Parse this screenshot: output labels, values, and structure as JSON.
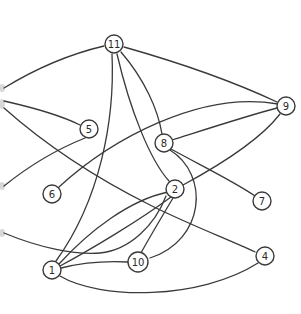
{
  "graph": {
    "title": "",
    "colors": {
      "stroke": "#3a3a3a",
      "node_fill": "#ffffff",
      "label": "#2a2a2a",
      "background": "#ffffff"
    },
    "nodes": [
      {
        "id": "11",
        "label": "11",
        "x": 114,
        "y": 44
      },
      {
        "id": "9",
        "label": "9",
        "x": 286,
        "y": 106
      },
      {
        "id": "5",
        "label": "5",
        "x": 89,
        "y": 129
      },
      {
        "id": "8",
        "label": "8",
        "x": 164,
        "y": 143
      },
      {
        "id": "6",
        "label": "6",
        "x": 52,
        "y": 194
      },
      {
        "id": "2",
        "label": "2",
        "x": 175,
        "y": 189
      },
      {
        "id": "7",
        "label": "7",
        "x": 262,
        "y": 201
      },
      {
        "id": "10",
        "label": "10",
        "x": 138,
        "y": 262
      },
      {
        "id": "4",
        "label": "4",
        "x": 265,
        "y": 256
      },
      {
        "id": "1",
        "label": "1",
        "x": 52,
        "y": 270
      }
    ],
    "edges": [
      {
        "from": "left-edge",
        "to": "11"
      },
      {
        "from": "left-edge",
        "to": "5"
      },
      {
        "from": "left-edge",
        "to": "4"
      },
      {
        "from": "left-edge",
        "to": "9"
      },
      {
        "from": "left-edge",
        "to": "2"
      },
      {
        "from": "11",
        "to": "9"
      },
      {
        "from": "11",
        "to": "1"
      },
      {
        "from": "11",
        "to": "10"
      },
      {
        "from": "11",
        "to": "8"
      },
      {
        "from": "11",
        "to": "2"
      },
      {
        "from": "6",
        "to": "9"
      },
      {
        "from": "8",
        "to": "9"
      },
      {
        "from": "8",
        "to": "7"
      },
      {
        "from": "8",
        "to": "1"
      },
      {
        "from": "2",
        "to": "9"
      },
      {
        "from": "2",
        "to": "1"
      },
      {
        "from": "2",
        "to": "10"
      },
      {
        "from": "1",
        "to": "10"
      },
      {
        "from": "1",
        "to": "4"
      }
    ]
  }
}
